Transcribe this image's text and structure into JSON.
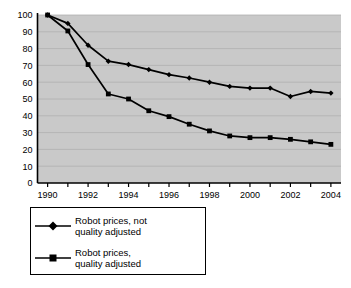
{
  "chart_data": {
    "type": "line",
    "title": "",
    "xlabel": "",
    "ylabel": "",
    "ylim": [
      0,
      100
    ],
    "xlim": [
      1989.5,
      2004.5
    ],
    "yticks": [
      0,
      10,
      20,
      30,
      40,
      50,
      60,
      70,
      80,
      90,
      100
    ],
    "xticks": [
      1990,
      1991,
      1992,
      1993,
      1994,
      1995,
      1996,
      1997,
      1998,
      1999,
      2000,
      2001,
      2002,
      2003,
      2004
    ],
    "xtick_labels_shown": [
      "1990",
      "1992",
      "1994",
      "1996",
      "1998",
      "2000",
      "2002",
      "2004"
    ],
    "grid": true,
    "grid_axis": "y",
    "legend_position": "below-left",
    "x": [
      1990,
      1991,
      1992,
      1993,
      1994,
      1995,
      1996,
      1997,
      1998,
      1999,
      2000,
      2001,
      2002,
      2003,
      2004
    ],
    "series": [
      {
        "name": "Robot prices, not quality adjusted",
        "marker": "diamond",
        "color": "#000000",
        "values": [
          100,
          95,
          82,
          72.5,
          70.5,
          67.5,
          64.5,
          62.5,
          60,
          57.5,
          56.5,
          56.5,
          51.5,
          54.5,
          53.5
        ]
      },
      {
        "name": "Robot prices, quality adjusted",
        "marker": "square",
        "color": "#000000",
        "values": [
          100,
          90.5,
          70.5,
          53,
          50,
          43,
          39.5,
          35,
          31,
          28,
          27,
          27,
          26,
          24.5,
          23
        ]
      }
    ],
    "series_end_values": [
      53.5,
      21
    ],
    "plot_background": "#c9c9c9",
    "gridline_color": "#b0b0b0",
    "axis_color": "#000000"
  },
  "legend": {
    "entries": [
      {
        "label": "Robot prices, not\nquality adjusted",
        "marker": "diamond-icon"
      },
      {
        "label": "Robot prices,\nquality adjusted",
        "marker": "square-icon"
      }
    ]
  }
}
